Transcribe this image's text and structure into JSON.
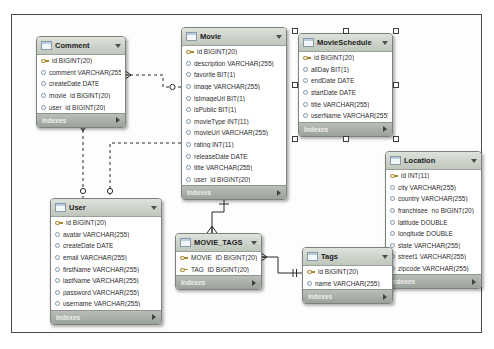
{
  "diagram": {
    "colors": {
      "header_bg_top": "#dde2da",
      "header_bg_bottom": "#bfc6bc",
      "footer_bg_top": "#b9beb9",
      "footer_bg_bottom": "#9ba19b",
      "card_border": "#7d827d",
      "line": "#2a2a2a",
      "pk_icon": "#a8842c",
      "column_icon": "#7d96ad",
      "selection_handle_border": "#3c3c3c"
    },
    "tables": [
      {
        "id": "comment",
        "title": "Comment",
        "selected": false,
        "footer_label": "Indexes",
        "columns": [
          {
            "label": "id BIGINT(20)",
            "key": true
          },
          {
            "label": "comment VARCHAR(255)",
            "key": false
          },
          {
            "label": "createDate DATE",
            "key": false
          },
          {
            "label": "movie_id BIGINT(20)",
            "key": false
          },
          {
            "label": "user_id BIGINT(20)",
            "key": false
          }
        ]
      },
      {
        "id": "movie",
        "title": "Movie",
        "selected": false,
        "footer_label": "Indexes",
        "columns": [
          {
            "label": "id BIGINT(20)",
            "key": true
          },
          {
            "label": "description VARCHAR(255)",
            "key": false
          },
          {
            "label": "favorite BIT(1)",
            "key": false
          },
          {
            "label": "image VARCHAR(255)",
            "key": false
          },
          {
            "label": "isImageUrl BIT(1)",
            "key": false
          },
          {
            "label": "isPublic BIT(1)",
            "key": false
          },
          {
            "label": "movieType INT(11)",
            "key": false
          },
          {
            "label": "movieUrl VARCHAR(255)",
            "key": false
          },
          {
            "label": "rating INT(11)",
            "key": false
          },
          {
            "label": "releaseDate DATE",
            "key": false
          },
          {
            "label": "title VARCHAR(255)",
            "key": false
          },
          {
            "label": "user_id BIGINT(20)",
            "key": false
          }
        ]
      },
      {
        "id": "movieschedule",
        "title": "MovieSchedule",
        "selected": true,
        "footer_label": "Indexes",
        "columns": [
          {
            "label": "id BIGINT(20)",
            "key": true
          },
          {
            "label": "allDay BIT(1)",
            "key": false
          },
          {
            "label": "endDate DATE",
            "key": false
          },
          {
            "label": "startDate DATE",
            "key": false
          },
          {
            "label": "title VARCHAR(255)",
            "key": false
          },
          {
            "label": "userName VARCHAR(255)",
            "key": false
          }
        ]
      },
      {
        "id": "location",
        "title": "Location",
        "selected": false,
        "footer_label": "Indexes",
        "columns": [
          {
            "label": "id INT(11)",
            "key": true
          },
          {
            "label": "city VARCHAR(255)",
            "key": false
          },
          {
            "label": "country VARCHAR(255)",
            "key": false
          },
          {
            "label": "franchisee_no BIGINT(20)",
            "key": false
          },
          {
            "label": "latitude DOUBLE",
            "key": false
          },
          {
            "label": "longitude DOUBLE",
            "key": false
          },
          {
            "label": "state VARCHAR(255)",
            "key": false
          },
          {
            "label": "street1 VARCHAR(255)",
            "key": false
          },
          {
            "label": "zipcode VARCHAR(255)",
            "key": false
          }
        ]
      },
      {
        "id": "user",
        "title": "User",
        "selected": false,
        "footer_label": "Indexes",
        "columns": [
          {
            "label": "id BIGINT(20)",
            "key": true
          },
          {
            "label": "avatar VARCHAR(255)",
            "key": false
          },
          {
            "label": "createDate DATE",
            "key": false
          },
          {
            "label": "email VARCHAR(255)",
            "key": false
          },
          {
            "label": "firstName VARCHAR(255)",
            "key": false
          },
          {
            "label": "lastName VARCHAR(255)",
            "key": false
          },
          {
            "label": "password VARCHAR(255)",
            "key": false
          },
          {
            "label": "username VARCHAR(255)",
            "key": false
          }
        ]
      },
      {
        "id": "movie_tags",
        "title": "MOVIE_TAGS",
        "selected": false,
        "footer_label": "Indexes",
        "columns": [
          {
            "label": "MOVIE_ID BIGINT(20)",
            "key": true
          },
          {
            "label": "TAG_ID BIGINT(20)",
            "key": true
          }
        ]
      },
      {
        "id": "tags",
        "title": "Tags",
        "selected": false,
        "footer_label": "Indexes",
        "columns": [
          {
            "label": "id BIGINT(20)",
            "key": true
          },
          {
            "label": "name VARCHAR(255)",
            "key": false
          }
        ]
      }
    ],
    "relationships": [
      {
        "id": "comment-movie",
        "from": "Comment",
        "to": "Movie",
        "type": "non-identifying"
      },
      {
        "id": "movie-user",
        "from": "Movie",
        "to": "User",
        "type": "non-identifying"
      },
      {
        "id": "comment-user",
        "from": "Comment",
        "to": "User",
        "type": "non-identifying"
      },
      {
        "id": "movietags-movie",
        "from": "MOVIE_TAGS",
        "to": "Movie",
        "type": "identifying"
      },
      {
        "id": "movietags-tags",
        "from": "MOVIE_TAGS",
        "to": "Tags",
        "type": "identifying"
      }
    ]
  }
}
